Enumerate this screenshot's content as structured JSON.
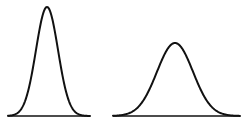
{
  "figure": {
    "stroke_color": "#111111",
    "background": "#ffffff"
  },
  "curves": [
    {
      "name": "narrow-tall-bell",
      "baseline": {
        "x1": 8,
        "x2": 90,
        "y": 116
      },
      "peak": {
        "x": 47,
        "y": 7
      },
      "sigma_px": 11
    },
    {
      "name": "wide-short-bell",
      "baseline": {
        "x1": 113,
        "x2": 240,
        "y": 116
      },
      "peak": {
        "x": 175,
        "y": 43
      },
      "sigma_px": 18
    }
  ]
}
